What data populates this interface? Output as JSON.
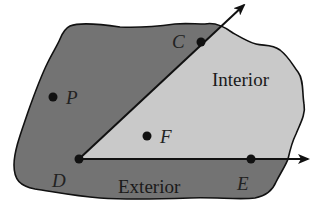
{
  "diagram": {
    "type": "angle-interior-exterior",
    "colors": {
      "exterior_fill": "#737373",
      "interior_fill": "#c9c9c9",
      "outline": "#111111",
      "ray": "#111111",
      "background": "#ffffff"
    },
    "vertex": {
      "label": "D",
      "x": 79,
      "y": 159
    },
    "rays": [
      {
        "name": "ray-DC",
        "through": "C",
        "arrow_end": {
          "x": 244,
          "y": 5
        }
      },
      {
        "name": "ray-DE",
        "through": "E",
        "arrow_end": {
          "x": 308,
          "y": 159
        }
      }
    ],
    "points": [
      {
        "label": "C",
        "x": 201,
        "y": 42,
        "label_x": 172,
        "label_y": 48
      },
      {
        "label": "P",
        "x": 53,
        "y": 97,
        "label_x": 66,
        "label_y": 104
      },
      {
        "label": "F",
        "x": 147,
        "y": 136,
        "label_x": 160,
        "label_y": 143
      },
      {
        "label": "D",
        "x": 79,
        "y": 159,
        "label_x": 52,
        "label_y": 187
      },
      {
        "label": "E",
        "x": 251,
        "y": 159,
        "label_x": 237,
        "label_y": 190
      }
    ],
    "regions": [
      {
        "name": "interior",
        "label": "Interior",
        "label_x": 212,
        "label_y": 86
      },
      {
        "name": "exterior",
        "label": "Exterior",
        "label_x": 118,
        "label_y": 193
      }
    ]
  }
}
